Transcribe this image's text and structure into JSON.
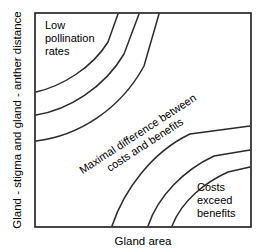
{
  "figure": {
    "title": "",
    "background_color": "#ffffff",
    "frame_color": "#1a1a1a",
    "curve_color": "#2b2b2b",
    "text_color": "#000000"
  },
  "axes": {
    "x_label": "Gland area",
    "y_label": "Gland - stigma and gland - anther distance",
    "x_ticks": [],
    "y_ticks": [],
    "grid": false
  },
  "annotations": {
    "top_left": {
      "lines": [
        "Low",
        "pollination",
        "rates"
      ],
      "line1": "Low",
      "line2": "pollination",
      "line3": "rates"
    },
    "diagonal": {
      "line1": "Maximal difference between",
      "line2": "costs and benefits",
      "rotation_deg": -33
    },
    "bottom_right": {
      "lines": [
        "Costs",
        "exceed",
        "benefits"
      ],
      "line1": "Costs",
      "line2": "exceed",
      "line3": "benefits"
    }
  },
  "chart_data": {
    "type": "line",
    "title": "",
    "xlabel": "Gland area",
    "ylabel": "Gland - stigma and gland - anther distance",
    "grid": false,
    "legend": "none",
    "plot_box": {
      "x": 35,
      "y": 13,
      "width": 216,
      "height": 214
    },
    "series": [
      {
        "name": "upper-contour-1",
        "family": "low-pollination",
        "path": "M 36,92 C 62,86 92,68 108,42 L 118,14"
      },
      {
        "name": "upper-contour-2",
        "family": "low-pollination",
        "path": "M 36,115 C 68,110 104,88 124,54 L 139,14"
      },
      {
        "name": "upper-contour-3",
        "family": "low-pollination",
        "path": "M 36,141 C 78,136 120,110 144,66 L 159,14"
      },
      {
        "name": "lower-contour-1",
        "family": "costs-exceed-benefits",
        "path": "M 112,226 C 124,190 152,152 190,134 L 250,126"
      },
      {
        "name": "lower-contour-2",
        "family": "costs-exceed-benefits",
        "path": "M 148,226 C 158,196 184,170 214,156 L 250,150"
      },
      {
        "name": "lower-contour-3",
        "family": "costs-exceed-benefits",
        "path": "M 172,226 C 182,200 206,182 228,172 L 250,167"
      }
    ]
  }
}
